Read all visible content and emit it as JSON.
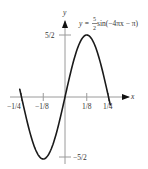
{
  "chart_data": {
    "type": "line",
    "title": "",
    "equation": {
      "prefix": "y = ",
      "frac_num": "5",
      "frac_den": "2",
      "suffix": " sin(−4πx − π)"
    },
    "xlabel": "x",
    "ylabel": "y",
    "xlim": [
      -0.3,
      0.3
    ],
    "ylim": [
      -2.5,
      2.5
    ],
    "x_ticks": [
      {
        "value": -0.25,
        "label": "−1/4"
      },
      {
        "value": -0.125,
        "label": "−1/8"
      },
      {
        "value": 0.125,
        "label": "1/8"
      },
      {
        "value": 0.25,
        "label": "1/4"
      }
    ],
    "y_ticks": [
      {
        "value": 2.5,
        "label": "5/2"
      },
      {
        "value": -2.5,
        "label": "−5/2"
      }
    ],
    "series": [
      {
        "name": "y = 5/2 sin(−4πx − π)",
        "function": "2.5*sin(-4*pi*x - pi)",
        "x": [
          -0.26,
          -0.25,
          -0.1875,
          -0.125,
          -0.0625,
          0,
          0.0625,
          0.125,
          0.1875,
          0.25,
          0.26
        ],
        "y": [
          0.31,
          0,
          -1.77,
          -2.5,
          -1.77,
          0,
          1.77,
          2.5,
          1.77,
          0,
          -0.31
        ]
      }
    ],
    "grid": false,
    "legend": "none",
    "colors": {
      "curve": "#1a1a1a",
      "axis": "#9a9a9a",
      "text": "#333333"
    }
  }
}
